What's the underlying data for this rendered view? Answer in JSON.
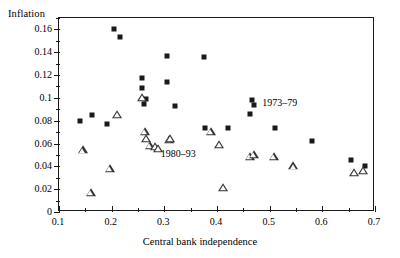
{
  "chart_data": {
    "type": "scatter",
    "title": "",
    "xlabel": "Central bank independence",
    "ylabel": "Inflation",
    "xlim": [
      0.1,
      0.7
    ],
    "ylim": [
      0,
      0.17
    ],
    "grid": false,
    "legend_position": "inside-plot",
    "x_ticks": [
      0.1,
      0.2,
      0.3,
      0.4,
      0.5,
      0.6,
      0.7
    ],
    "x_tick_labels": [
      "0.1",
      "0.2",
      "0.3",
      "0.4",
      "0.5",
      "0.6",
      "0.7"
    ],
    "x_minor_ticks": [
      0.15,
      0.25,
      0.35,
      0.45,
      0.55,
      0.65
    ],
    "y_ticks": [
      0,
      0.02,
      0.04,
      0.06,
      0.08,
      0.1,
      0.12,
      0.14,
      0.16
    ],
    "y_tick_labels": [
      "0",
      "0.02",
      "0.04",
      "0.06",
      "0.08",
      "0.1",
      "0.12",
      "0.14",
      "0.16"
    ],
    "y_minor_ticks": [
      0.01,
      0.03,
      0.05,
      0.07,
      0.09,
      0.11,
      0.13,
      0.15,
      0.17
    ],
    "series": [
      {
        "name": "1973–79",
        "marker": "filled-square",
        "color": "#1a1a1a",
        "points": [
          [
            0.14,
            0.08
          ],
          [
            0.163,
            0.085
          ],
          [
            0.192,
            0.077
          ],
          [
            0.205,
            0.16
          ],
          [
            0.216,
            0.153
          ],
          [
            0.258,
            0.117
          ],
          [
            0.258,
            0.109
          ],
          [
            0.262,
            0.095
          ],
          [
            0.266,
            0.099
          ],
          [
            0.305,
            0.137
          ],
          [
            0.305,
            0.114
          ],
          [
            0.32,
            0.093
          ],
          [
            0.376,
            0.136
          ],
          [
            0.378,
            0.074
          ],
          [
            0.42,
            0.074
          ],
          [
            0.462,
            0.086
          ],
          [
            0.466,
            0.098
          ],
          [
            0.51,
            0.074
          ],
          [
            0.58,
            0.062
          ],
          [
            0.655,
            0.046
          ],
          [
            0.681,
            0.04
          ]
        ]
      },
      {
        "name": "1980–93",
        "marker": "open-triangle",
        "color": "#333333",
        "points": [
          [
            0.145,
            0.054
          ],
          [
            0.16,
            0.017
          ],
          [
            0.196,
            0.038
          ],
          [
            0.211,
            0.085
          ],
          [
            0.258,
            0.1
          ],
          [
            0.263,
            0.07
          ],
          [
            0.266,
            0.064
          ],
          [
            0.272,
            0.058
          ],
          [
            0.283,
            0.057
          ],
          [
            0.288,
            0.055
          ],
          [
            0.308,
            0.063
          ],
          [
            0.311,
            0.064
          ],
          [
            0.388,
            0.07
          ],
          [
            0.404,
            0.059
          ],
          [
            0.412,
            0.021
          ],
          [
            0.462,
            0.048
          ],
          [
            0.47,
            0.05
          ],
          [
            0.508,
            0.048
          ],
          [
            0.545,
            0.04
          ],
          [
            0.66,
            0.034
          ],
          [
            0.678,
            0.036
          ]
        ]
      }
    ],
    "annotations": [
      {
        "text": "1973–79",
        "x": 0.488,
        "y": 0.094,
        "marker": "filled-square",
        "marker_x": 0.47,
        "marker_y": 0.094
      },
      {
        "text": "1980–93",
        "x": 0.295,
        "y": 0.049,
        "marker": "none"
      }
    ]
  }
}
